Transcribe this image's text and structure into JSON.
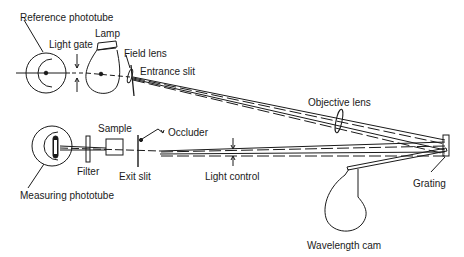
{
  "diagram": {
    "type": "optical schematic",
    "labels": {
      "reference_phototube": "Reference phototube",
      "light_gate": "Light gate",
      "lamp": "Lamp",
      "field_lens": "Field lens",
      "entrance_slit": "Entrance slit",
      "objective_lens": "Objective lens",
      "sample": "Sample",
      "occluder": "Occluder",
      "filter": "Filter",
      "exit_slit": "Exit slit",
      "light_control": "Light control",
      "grating": "Grating",
      "measuring_phototube": "Measuring phototube",
      "wavelength_cam": "Wavelength cam"
    },
    "colors": {
      "line": "#1a1a1a",
      "background": "#ffffff"
    }
  }
}
